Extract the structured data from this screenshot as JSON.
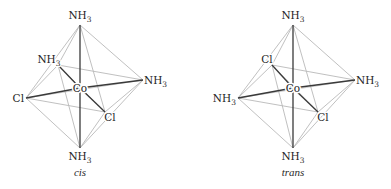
{
  "figure": {
    "colors": {
      "background": "#ffffff",
      "bond": "#3a3a3a",
      "edge": "#b9b9b9",
      "text": "#1e1e1e"
    },
    "isomers": [
      {
        "caption": "cis",
        "center": {
          "label": "Co",
          "x": 80,
          "y": 88
        },
        "vertices": [
          {
            "id": "top",
            "label": "NH",
            "sub": "3",
            "x": 80,
            "y": 25,
            "lx": 80,
            "ly": 19,
            "anchor": "middle"
          },
          {
            "id": "back",
            "label": "NH",
            "sub": "3",
            "x": 58,
            "y": 65,
            "lx": 49,
            "ly": 63,
            "anchor": "middle"
          },
          {
            "id": "right",
            "label": "NH",
            "sub": "3",
            "x": 143,
            "y": 80,
            "lx": 144,
            "ly": 84,
            "anchor": "start"
          },
          {
            "id": "left",
            "label": "Cl",
            "sub": "",
            "x": 26,
            "y": 98,
            "lx": 24,
            "ly": 102,
            "anchor": "end"
          },
          {
            "id": "front",
            "label": "Cl",
            "sub": "",
            "x": 105,
            "y": 112,
            "lx": 110,
            "ly": 121,
            "anchor": "middle"
          },
          {
            "id": "bottom",
            "label": "NH",
            "sub": "3",
            "x": 80,
            "y": 148,
            "lx": 80,
            "ly": 160,
            "anchor": "middle"
          }
        ],
        "caption_pos": {
          "x": 80,
          "y": 176
        }
      },
      {
        "caption": "trans",
        "center": {
          "label": "Co",
          "x": 293,
          "y": 88
        },
        "vertices": [
          {
            "id": "top",
            "label": "NH",
            "sub": "3",
            "x": 293,
            "y": 25,
            "lx": 293,
            "ly": 19,
            "anchor": "middle"
          },
          {
            "id": "back",
            "label": "Cl",
            "sub": "",
            "x": 272,
            "y": 65,
            "lx": 267,
            "ly": 63,
            "anchor": "middle"
          },
          {
            "id": "right",
            "label": "NH",
            "sub": "3",
            "x": 355,
            "y": 80,
            "lx": 356,
            "ly": 84,
            "anchor": "start"
          },
          {
            "id": "left",
            "label": "NH",
            "sub": "3",
            "x": 238,
            "y": 98,
            "lx": 236,
            "ly": 102,
            "anchor": "end"
          },
          {
            "id": "front",
            "label": "Cl",
            "sub": "",
            "x": 318,
            "y": 112,
            "lx": 323,
            "ly": 121,
            "anchor": "middle"
          },
          {
            "id": "bottom",
            "label": "NH",
            "sub": "3",
            "x": 293,
            "y": 148,
            "lx": 293,
            "ly": 160,
            "anchor": "middle"
          }
        ],
        "caption_pos": {
          "x": 293,
          "y": 176
        }
      }
    ]
  }
}
